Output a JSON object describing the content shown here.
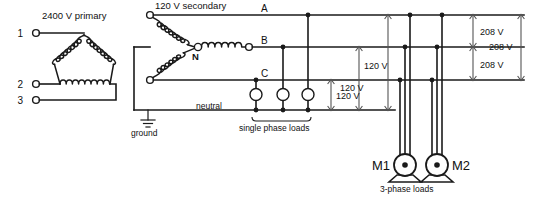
{
  "diagram": {
    "title_primary": "2400 V primary",
    "title_secondary": "120 V secondary",
    "primary_terminals": [
      "1",
      "2",
      "3"
    ],
    "neutral_point_label": "N",
    "phase_labels": [
      "A",
      "B",
      "C"
    ],
    "neutral_bus_label": "neutral",
    "ground_label": "ground",
    "single_phase_loads_label": "single phase loads",
    "three_phase_loads_label": "3-phase loads",
    "motors": [
      {
        "label": "M1"
      },
      {
        "label": "M2"
      }
    ],
    "dimensions_120": [
      {
        "label": "120 V"
      },
      {
        "label": "120 V"
      },
      {
        "label": "120 V"
      }
    ],
    "dimensions_208": [
      {
        "label": "208 V"
      },
      {
        "label": "208 V"
      },
      {
        "label": "208 V"
      }
    ],
    "colors": {
      "wire": "#1a1a1a",
      "dimension": "#555555",
      "background": "#ffffff"
    }
  }
}
